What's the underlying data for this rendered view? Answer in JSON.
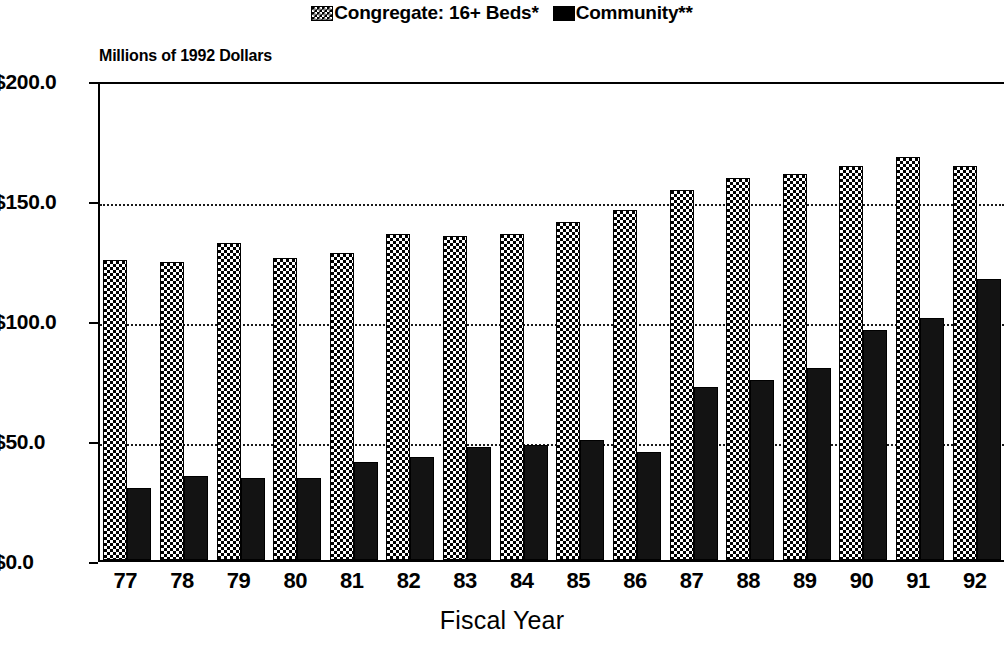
{
  "legend": {
    "entries": [
      {
        "label": "Congregate: 16+ Beds*",
        "swatch": "checkered-swatch-icon",
        "color": "#000000"
      },
      {
        "label": "Community**",
        "swatch": "solid-swatch-icon",
        "color": "#000000"
      }
    ]
  },
  "axis_note": "Millions of 1992 Dollars",
  "xaxis_title": "Fiscal Year",
  "chart_data": {
    "type": "bar",
    "title": "",
    "subtitle": "",
    "xlabel": "Fiscal Year",
    "ylabel": "Millions of 1992 Dollars",
    "ylim": [
      0,
      200
    ],
    "ytick_labels": [
      "$0.0",
      "$50.0",
      "$100.0",
      "$150.0",
      "$200.0"
    ],
    "ytick_values": [
      0,
      50,
      100,
      150,
      200
    ],
    "grid": true,
    "grid_axis": "y",
    "legend_position": "top-center",
    "categories": [
      "77",
      "78",
      "79",
      "80",
      "81",
      "82",
      "83",
      "84",
      "85",
      "86",
      "87",
      "88",
      "89",
      "90",
      "91",
      "92"
    ],
    "series": [
      {
        "name": "Congregate: 16+ Beds*",
        "values": [
          125,
          124,
          132,
          126,
          128,
          136,
          135,
          136,
          141,
          146,
          154,
          159,
          161,
          164,
          168,
          164
        ]
      },
      {
        "name": "Community**",
        "values": [
          30,
          35,
          34,
          34,
          41,
          43,
          47,
          48,
          50,
          45,
          72,
          75,
          80,
          96,
          101,
          117
        ]
      }
    ],
    "annotations": []
  }
}
